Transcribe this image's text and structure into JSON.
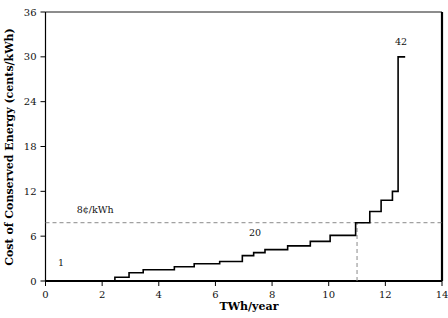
{
  "chart_data": {
    "type": "line",
    "subtype": "step",
    "title": "",
    "xlabel": "TWh/year",
    "ylabel": "Cost of Conserved Energy (cents/kWh)",
    "xlim": [
      0,
      14
    ],
    "ylim": [
      0,
      36
    ],
    "xticks": [
      0,
      2,
      4,
      6,
      8,
      10,
      12,
      14
    ],
    "xtick_labels": [
      "0",
      "2",
      "4",
      "6",
      "8",
      "10",
      "12",
      "14"
    ],
    "yticks": [
      0,
      6,
      12,
      18,
      24,
      30,
      36
    ],
    "ytick_labels": [
      "0",
      "6",
      "12",
      "18",
      "24",
      "30",
      "36"
    ],
    "grid": false,
    "legend": "none",
    "series": [
      {
        "name": "supply curve",
        "step": "post",
        "x": [
          0.0,
          2.45,
          2.45,
          2.95,
          2.95,
          3.45,
          3.45,
          4.55,
          4.55,
          5.25,
          5.25,
          6.15,
          6.15,
          6.95,
          6.95,
          7.35,
          7.35,
          7.75,
          7.75,
          8.55,
          8.55,
          9.35,
          9.35,
          10.05,
          10.05,
          10.95,
          10.95,
          11.45,
          11.45,
          11.85,
          11.85,
          12.25,
          12.25,
          12.45,
          12.45,
          12.7
        ],
        "y": [
          0.0,
          0.0,
          0.5,
          0.5,
          1.1,
          1.1,
          1.5,
          1.5,
          1.9,
          1.9,
          2.3,
          2.3,
          2.6,
          2.6,
          3.4,
          3.4,
          3.8,
          3.8,
          4.2,
          4.2,
          4.7,
          4.7,
          5.3,
          5.3,
          6.1,
          6.1,
          7.8,
          7.8,
          9.3,
          9.3,
          10.8,
          10.8,
          12.0,
          12.0,
          30.0,
          30.0
        ]
      }
    ],
    "reference_lines": [
      {
        "name": "cost-threshold",
        "orientation": "horizontal",
        "value": 7.8,
        "label": "8¢/kWh",
        "label_x": 1.1,
        "label_y": 9.1,
        "style": "dashed"
      },
      {
        "name": "potential-threshold",
        "orientation": "vertical",
        "value": 11.0,
        "y_from": 0,
        "y_to": 7.8,
        "label": "",
        "style": "dashed"
      }
    ],
    "annotations": [
      {
        "name": "segment-label-1",
        "text": "1",
        "x": 0.55,
        "y": 2.0
      },
      {
        "name": "segment-label-20",
        "text": "20",
        "x": 7.4,
        "y": 6.0
      },
      {
        "name": "segment-label-42",
        "text": "42",
        "x": 12.55,
        "y": 31.6
      }
    ],
    "colors": {
      "line": "#000000",
      "axis": "#000000",
      "reference": "#8a8a8a",
      "background": "#ffffff",
      "text": "#111111"
    }
  }
}
